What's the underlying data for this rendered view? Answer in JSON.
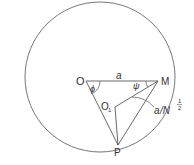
{
  "diagram": {
    "points": {
      "O": {
        "label": "O",
        "x": 86,
        "y": 81
      },
      "M": {
        "label": "M",
        "x": 158,
        "y": 81
      },
      "O1": {
        "label": "O",
        "sub": "1",
        "x": 115,
        "y": 107
      },
      "P": {
        "label": "P",
        "x": 118,
        "y": 145
      }
    },
    "circle": {
      "cx": 100,
      "cy": 77,
      "r": 75
    },
    "labels": {
      "a": "a",
      "phi": "ϕ",
      "psi": "ψ",
      "chord_label_a": "a",
      "chord_label_slash": "/N",
      "chord_label_exp_num": "1",
      "chord_label_exp_den": "2"
    },
    "stroke_color": "#444444"
  }
}
